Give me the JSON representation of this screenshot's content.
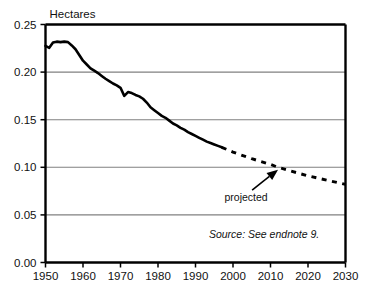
{
  "chart_data": {
    "type": "line",
    "title": "",
    "xlabel": "",
    "ylabel": "Hectares",
    "xlim": [
      1950,
      2030
    ],
    "ylim": [
      0.0,
      0.25
    ],
    "grid": true,
    "legend": "none",
    "xticks": [
      1950,
      1960,
      1970,
      1980,
      1990,
      2000,
      2010,
      2020,
      2030
    ],
    "xtick_labels": [
      "1950",
      "1960",
      "1970",
      "1980",
      "1990",
      "2000",
      "2010",
      "2020",
      "2030"
    ],
    "yticks": [
      0.0,
      0.05,
      0.1,
      0.15,
      0.2,
      0.25
    ],
    "ytick_labels": [
      "0.00",
      "0.05",
      "0.10",
      "0.15",
      "0.20",
      "0.25"
    ],
    "series": [
      {
        "name": "historical",
        "style": "solid",
        "x": [
          1950,
          1951,
          1952,
          1953,
          1954,
          1955,
          1956,
          1957,
          1958,
          1959,
          1960,
          1961,
          1962,
          1963,
          1964,
          1965,
          1966,
          1967,
          1968,
          1969,
          1970,
          1971,
          1972,
          1973,
          1974,
          1975,
          1976,
          1977,
          1978,
          1979,
          1980,
          1981,
          1982,
          1983,
          1984,
          1985,
          1986,
          1987,
          1988,
          1989,
          1990,
          1991,
          1992,
          1993,
          1994,
          1995,
          1996,
          1997
        ],
        "values": [
          0.2275,
          0.2255,
          0.231,
          0.232,
          0.2315,
          0.232,
          0.2315,
          0.228,
          0.224,
          0.218,
          0.212,
          0.208,
          0.204,
          0.2015,
          0.199,
          0.196,
          0.193,
          0.1905,
          0.188,
          0.186,
          0.1835,
          0.175,
          0.179,
          0.178,
          0.176,
          0.1745,
          0.172,
          0.168,
          0.163,
          0.16,
          0.157,
          0.154,
          0.152,
          0.149,
          0.146,
          0.144,
          0.1415,
          0.1395,
          0.137,
          0.135,
          0.133,
          0.131,
          0.129,
          0.127,
          0.1255,
          0.124,
          0.1225,
          0.121
        ]
      },
      {
        "name": "projected",
        "style": "dashed",
        "x": [
          1997,
          2000,
          2005,
          2010,
          2012,
          2015,
          2020,
          2025,
          2030
        ],
        "values": [
          0.121,
          0.116,
          0.109,
          0.103,
          0.1,
          0.0965,
          0.091,
          0.0865,
          0.082
        ]
      }
    ],
    "annotations": [
      {
        "name": "projected-annotation",
        "text": "projected",
        "x": 2003.5,
        "y": 0.0645,
        "arrow_to_x": 2012.0,
        "arrow_to_y": 0.0975
      },
      {
        "name": "source-note",
        "text": "Source: See endnote 9.",
        "x": 2023.0,
        "y": 0.0255
      }
    ],
    "colors": {
      "line": "#000000",
      "grid": "#808080",
      "axis": "#000000",
      "background": "#ffffff",
      "text": "#111111"
    }
  }
}
